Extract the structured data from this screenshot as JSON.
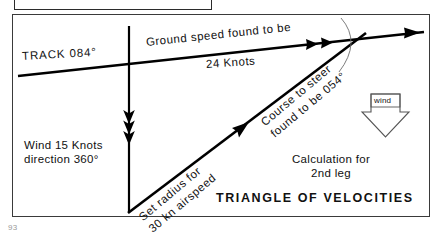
{
  "page": {
    "page_number": "93",
    "background_color": "#ffffff",
    "ink_color": "#000000"
  },
  "figure": {
    "title": "TRIANGLE OF VELOCITIES",
    "caption_note": "Calculation for",
    "caption_note_line2": "2nd leg",
    "labels": {
      "track": "TRACK 084°",
      "ground_speed_line1": "Ground speed found to be",
      "ground_speed_line2": "24 Knots",
      "wind_line1": "Wind 15 Knots",
      "wind_line2": "direction 360°",
      "course_line1": "Course to steer",
      "course_line2": "found to be 054°",
      "radius_line1": "Set radius for",
      "radius_line2": "30 kn airspeed",
      "wind_badge": "wind"
    },
    "values": {
      "track_degrees": "084",
      "ground_speed_knots": "24",
      "wind_speed_knots": "15",
      "wind_direction_degrees": "360",
      "course_to_steer_degrees": "054",
      "airspeed_knots": "30",
      "leg_number": "2nd"
    },
    "vectors": [
      {
        "name": "track-ground-speed-vector",
        "label": "Ground speed found to be 24 Knots",
        "arrowheads": "double-plus-single",
        "direction": "east-north-east"
      },
      {
        "name": "wind-vector",
        "label": "Wind 15 Knots direction 360°",
        "arrowheads": "triple",
        "direction": "south"
      },
      {
        "name": "airspeed-heading-vector",
        "label": "Course to steer found to be 054°",
        "arrowheads": "single",
        "direction": "north-east"
      }
    ],
    "arc": {
      "name": "airspeed-radius-arc",
      "description": "Set radius for 30 kn airspeed"
    }
  }
}
